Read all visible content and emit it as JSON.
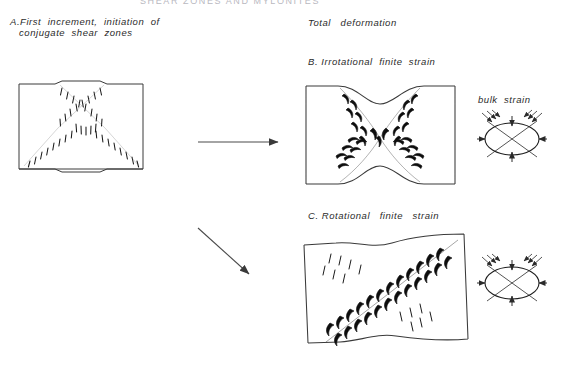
{
  "figure": {
    "header": "SHEAR ZONES AND MYLONITES",
    "background_color": "#ffffff",
    "ink_color": "#1a1a1a",
    "labels": {
      "panel_a_line1": "A.First  increment,  initiation  of",
      "panel_a_line2": "conjugate  shear  zones",
      "total_deformation": "Total   deformation",
      "panel_b": "B. Irrotational  finite  strain",
      "panel_c": "C. Rotational   finite   strain",
      "bulk_strain": "bulk  strain"
    },
    "panels": [
      {
        "id": "A",
        "name": "first-increment-block",
        "caption": "A.First  increment,  initiation  of conjugate  shear  zones",
        "shape": "rectangular-block",
        "bounds": {
          "x": 19,
          "y": 83,
          "w": 124,
          "h": 87
        },
        "shear_zones": "conjugate-X-pair",
        "marks": "thin-tick-marks"
      },
      {
        "id": "B",
        "name": "irrotational-finite-strain-block",
        "caption": "B. Irrotational  finite  strain",
        "shape": "necked-symmetric-block",
        "bounds": {
          "x": 305,
          "y": 85,
          "w": 150,
          "h": 100
        },
        "shear_zones": "conjugate-X-pair",
        "marks": "bold-flame-marks"
      },
      {
        "id": "C",
        "name": "rotational-finite-strain-block",
        "caption": "C. Rotational   finite   strain",
        "shape": "sheared-skewed-block",
        "bounds": {
          "x": 303,
          "y": 238,
          "w": 165,
          "h": 109
        },
        "shear_zones": "dominant-single-diagonal",
        "marks": "bold-flame-marks-and-ticks"
      }
    ],
    "strain_ellipses": [
      {
        "id": "bulk-strain-ellipse-b",
        "label": "bulk  strain",
        "cx": 512,
        "cy": 139,
        "rx": 27,
        "ry": 16,
        "rotation_deg": 0,
        "arrows": "shortening-vertical-extension-horizontal"
      },
      {
        "id": "bulk-strain-ellipse-c",
        "label": "",
        "cx": 512,
        "cy": 283,
        "rx": 27,
        "ry": 16,
        "rotation_deg": 0,
        "arrows": "shortening-vertical-extension-horizontal"
      }
    ],
    "arrows": [
      {
        "name": "arrow-a-to-b",
        "x1": 198,
        "y1": 142,
        "x2": 280,
        "y2": 142
      },
      {
        "name": "arrow-a-to-c",
        "x1": 198,
        "y1": 228,
        "x2": 252,
        "y2": 277
      }
    ]
  }
}
